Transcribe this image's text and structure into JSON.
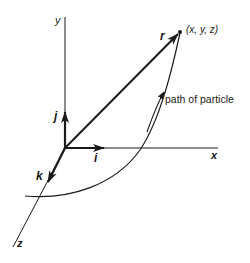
{
  "diagram": {
    "axes": {
      "x_label": "x",
      "y_label": "y",
      "z_label": "z"
    },
    "unit_vectors": {
      "i": "i",
      "j": "j",
      "k": "k"
    },
    "position_vector": "r",
    "point_label": "(x, y, z)",
    "path_label": "path of particle",
    "colors": {
      "stroke": "#1a1a1a",
      "background": "#ffffff"
    }
  }
}
